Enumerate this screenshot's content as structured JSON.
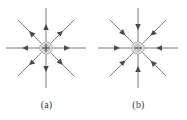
{
  "figure": {
    "background_color": "#ffffff",
    "width": 187,
    "height": 120
  },
  "style": {
    "line_color": "#6b6b6b",
    "arrow_color": "#4a4a4a",
    "charge_fill": "#c9c9c9",
    "charge_stroke": "#9a9a9a",
    "charge_halo": "#e0e0e0",
    "sign_color": "#3c3c3c",
    "caption_color": "#3a3a3a"
  },
  "panels": [
    {
      "id": "a",
      "caption": "(a)",
      "charge_sign": "+",
      "charge_polarity": "positive",
      "field_direction": "outward",
      "num_field_lines": 8,
      "line_angles_deg": [
        0,
        45,
        90,
        135,
        180,
        225,
        270,
        315
      ],
      "center": {
        "x": 46,
        "y": 46
      },
      "line_length": 40,
      "charge_radius": 6
    },
    {
      "id": "b",
      "caption": "(b)",
      "charge_sign": "−",
      "charge_polarity": "negative",
      "field_direction": "inward",
      "num_field_lines": 8,
      "line_angles_deg": [
        0,
        45,
        90,
        135,
        180,
        225,
        270,
        315
      ],
      "center": {
        "x": 46,
        "y": 46
      },
      "line_length": 40,
      "charge_radius": 6
    }
  ]
}
